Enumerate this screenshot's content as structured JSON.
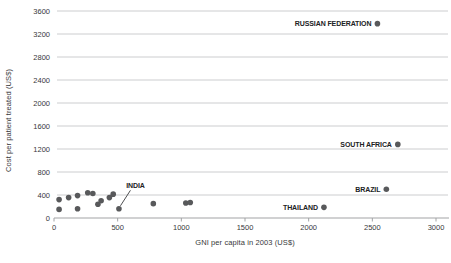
{
  "colors": {
    "dot": "#58595b",
    "gridline": "#cccdcf",
    "baseline": "#a2a3a5",
    "tick_text": "#37383a",
    "country_label_text": "#212224",
    "leader_line": "#3a3b3d",
    "background": "#ffffff"
  },
  "chart_data": {
    "type": "scatter",
    "title": "",
    "xlabel": "GNI per capita in 2003 (US$)",
    "ylabel": "Cost per patient treated (US$)",
    "xlim": [
      0,
      3000
    ],
    "ylim": [
      0,
      3600
    ],
    "xticks": [
      0,
      500,
      1000,
      1500,
      2000,
      2500,
      3000
    ],
    "yticks": [
      0,
      400,
      800,
      1200,
      1600,
      2000,
      2400,
      2800,
      3200,
      3600
    ],
    "grid": "horizontal-only",
    "legend": "none",
    "points": [
      {
        "x": 40,
        "y": 320
      },
      {
        "x": 115,
        "y": 355
      },
      {
        "x": 185,
        "y": 390
      },
      {
        "x": 265,
        "y": 440
      },
      {
        "x": 305,
        "y": 425
      },
      {
        "x": 40,
        "y": 150
      },
      {
        "x": 185,
        "y": 160
      },
      {
        "x": 345,
        "y": 240
      },
      {
        "x": 370,
        "y": 300
      },
      {
        "x": 435,
        "y": 355
      },
      {
        "x": 465,
        "y": 415
      },
      {
        "x": 510,
        "y": 160,
        "label": "INDIA",
        "label_pos": "callout-above"
      },
      {
        "x": 780,
        "y": 250
      },
      {
        "x": 1035,
        "y": 260
      },
      {
        "x": 1070,
        "y": 270
      },
      {
        "x": 2120,
        "y": 185,
        "label": "THAILAND",
        "label_pos": "left"
      },
      {
        "x": 2610,
        "y": 500,
        "label": "BRAZIL",
        "label_pos": "left"
      },
      {
        "x": 2700,
        "y": 1280,
        "label": "SOUTH AFRICA",
        "label_pos": "left"
      },
      {
        "x": 2540,
        "y": 3380,
        "label": "RUSSIAN FEDERATION",
        "label_pos": "left"
      }
    ]
  }
}
